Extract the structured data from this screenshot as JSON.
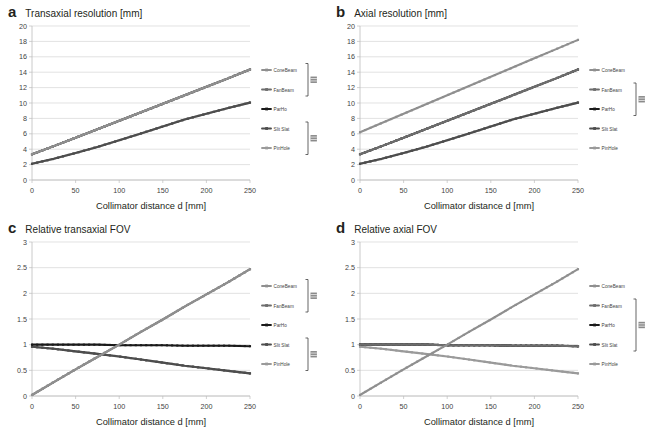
{
  "figure": {
    "xlabel": "Collimator distance d [mm]",
    "series_names": [
      "ConeBeam",
      "FanBeam",
      "ParHo",
      "Slit Slat",
      "PinHole"
    ],
    "colors": {
      "ConeBeam": "#8f8f8f",
      "FanBeam": "#6d6d6d",
      "ParHo": "#1a1a1a",
      "SlitSlat": "#4d4d4d",
      "PinHole": "#9a9a9a",
      "grid": "#d6d6d6",
      "axis": "#bdbdbd",
      "text": "#3f3f3f"
    }
  },
  "panels": [
    {
      "letter": "a",
      "title": "Transaxial resolution [mm]",
      "chart_data": {
        "type": "line",
        "title": "Transaxial resolution [mm]",
        "xlabel": "Collimator distance d [mm]",
        "ylabel": "Transaxial resolution [mm]",
        "xlim": [
          0,
          250
        ],
        "ylim": [
          0,
          20
        ],
        "xticks": [
          0,
          50,
          100,
          150,
          200,
          250
        ],
        "yticks": [
          0,
          2,
          4,
          6,
          8,
          10,
          12,
          14,
          16,
          18,
          20
        ],
        "grid": true,
        "legend_position": "right",
        "x": [
          0,
          25,
          50,
          75,
          100,
          125,
          150,
          175,
          200,
          225,
          250
        ],
        "series": [
          {
            "name": "ConeBeam",
            "values": [
              3.35,
              4.4,
              5.5,
              6.6,
              7.7,
              8.8,
              9.9,
              11.0,
              12.1,
              13.2,
              14.35
            ]
          },
          {
            "name": "FanBeam",
            "values": [
              3.35,
              4.4,
              5.5,
              6.6,
              7.7,
              8.8,
              9.9,
              11.0,
              12.1,
              13.2,
              14.35
            ]
          },
          {
            "name": "ParHo",
            "values": [
              3.35,
              4.4,
              5.5,
              6.6,
              7.7,
              8.8,
              9.9,
              11.0,
              12.1,
              13.2,
              14.35
            ]
          },
          {
            "name": "Slit Slat",
            "values": [
              2.1,
              2.75,
              3.5,
              4.3,
              5.15,
              6.05,
              6.95,
              7.85,
              8.6,
              9.35,
              10.05
            ]
          },
          {
            "name": "PinHole",
            "values": [
              2.1,
              2.75,
              3.5,
              4.3,
              5.15,
              6.05,
              6.95,
              7.85,
              8.6,
              9.35,
              10.05
            ]
          }
        ],
        "legend_brackets": [
          {
            "from": "ConeBeam",
            "to": "FanBeam"
          },
          {
            "from": "Slit Slat",
            "to": "PinHole"
          }
        ]
      }
    },
    {
      "letter": "b",
      "title": "Axial resolution [mm]",
      "chart_data": {
        "type": "line",
        "title": "Axial resolution [mm]",
        "xlabel": "Collimator distance d [mm]",
        "ylabel": "Axial resolution [mm]",
        "xlim": [
          0,
          250
        ],
        "ylim": [
          0,
          20
        ],
        "xticks": [
          0,
          50,
          100,
          150,
          200,
          250
        ],
        "yticks": [
          0,
          2,
          4,
          6,
          8,
          10,
          12,
          14,
          16,
          18,
          20
        ],
        "grid": true,
        "legend_position": "right",
        "x": [
          0,
          25,
          50,
          75,
          100,
          125,
          150,
          175,
          200,
          225,
          250
        ],
        "series": [
          {
            "name": "ConeBeam",
            "values": [
              6.2,
              7.4,
              8.6,
              9.8,
              11.0,
              12.2,
              13.4,
              14.6,
              15.8,
              17.0,
              18.2
            ]
          },
          {
            "name": "FanBeam",
            "values": [
              3.35,
              4.4,
              5.5,
              6.6,
              7.7,
              8.8,
              9.9,
              11.0,
              12.1,
              13.2,
              14.35
            ]
          },
          {
            "name": "ParHo",
            "values": [
              3.35,
              4.4,
              5.5,
              6.6,
              7.7,
              8.8,
              9.9,
              11.0,
              12.1,
              13.2,
              14.35
            ]
          },
          {
            "name": "Slit Slat",
            "values": [
              2.1,
              2.75,
              3.5,
              4.3,
              5.15,
              6.05,
              6.95,
              7.85,
              8.6,
              9.35,
              10.05
            ]
          },
          {
            "name": "PinHole",
            "values": [
              2.1,
              2.75,
              3.5,
              4.3,
              5.15,
              6.05,
              6.95,
              7.85,
              8.6,
              9.35,
              10.05
            ]
          }
        ],
        "legend_brackets": [
          {
            "from": "FanBeam",
            "to": "ParHo"
          }
        ]
      }
    },
    {
      "letter": "c",
      "title": "Relative transaxial FOV",
      "chart_data": {
        "type": "line",
        "title": "Relative transaxial FOV",
        "xlabel": "Collimator distance d [mm]",
        "ylabel": "Relative transaxial FOV",
        "xlim": [
          0,
          250
        ],
        "ylim": [
          0,
          3
        ],
        "xticks": [
          0,
          50,
          100,
          150,
          200,
          250
        ],
        "yticks": [
          0,
          0.5,
          1,
          1.5,
          2,
          2.5,
          3
        ],
        "grid": true,
        "legend_position": "right",
        "x": [
          0,
          25,
          50,
          75,
          100,
          125,
          150,
          175,
          200,
          225,
          250
        ],
        "series": [
          {
            "name": "ConeBeam",
            "values": [
              0.02,
              0.27,
              0.52,
              0.76,
              1.0,
              1.25,
              1.49,
              1.74,
              1.98,
              2.22,
              2.47
            ]
          },
          {
            "name": "FanBeam",
            "values": [
              0.02,
              0.27,
              0.52,
              0.76,
              1.0,
              1.25,
              1.49,
              1.74,
              1.98,
              2.22,
              2.47
            ]
          },
          {
            "name": "ParHo",
            "values": [
              1.0,
              1.0,
              1.0,
              1.0,
              0.99,
              0.99,
              0.99,
              0.98,
              0.98,
              0.98,
              0.97
            ]
          },
          {
            "name": "Slit Slat",
            "values": [
              0.96,
              0.92,
              0.87,
              0.82,
              0.77,
              0.71,
              0.65,
              0.59,
              0.54,
              0.49,
              0.44
            ]
          },
          {
            "name": "PinHole",
            "values": [
              0.96,
              0.92,
              0.87,
              0.82,
              0.77,
              0.71,
              0.65,
              0.59,
              0.54,
              0.49,
              0.44
            ]
          }
        ],
        "legend_brackets": [
          {
            "from": "ConeBeam",
            "to": "FanBeam"
          },
          {
            "from": "Slit Slat",
            "to": "PinHole"
          }
        ]
      }
    },
    {
      "letter": "d",
      "title": "Relative axial FOV",
      "chart_data": {
        "type": "line",
        "title": "Relative axial FOV",
        "xlabel": "Collimator distance d [mm]",
        "ylabel": "Relative axial FOV",
        "xlim": [
          0,
          250
        ],
        "ylim": [
          0,
          3
        ],
        "xticks": [
          0,
          50,
          100,
          150,
          200,
          250
        ],
        "yticks": [
          0,
          0.5,
          1,
          1.5,
          2,
          2.5,
          3
        ],
        "grid": true,
        "legend_position": "right",
        "x": [
          0,
          25,
          50,
          75,
          100,
          125,
          150,
          175,
          200,
          225,
          250
        ],
        "series": [
          {
            "name": "ConeBeam",
            "values": [
              0.02,
              0.27,
              0.52,
              0.76,
              1.0,
              1.25,
              1.49,
              1.74,
              1.98,
              2.22,
              2.47
            ]
          },
          {
            "name": "FanBeam",
            "values": [
              1.0,
              1.0,
              1.0,
              1.0,
              0.99,
              0.99,
              0.99,
              0.98,
              0.98,
              0.98,
              0.97
            ]
          },
          {
            "name": "ParHo",
            "values": [
              1.0,
              1.0,
              1.0,
              1.0,
              0.99,
              0.99,
              0.99,
              0.98,
              0.98,
              0.98,
              0.97
            ]
          },
          {
            "name": "Slit Slat",
            "values": [
              1.0,
              1.0,
              1.0,
              1.0,
              0.99,
              0.99,
              0.99,
              0.98,
              0.98,
              0.98,
              0.97
            ]
          },
          {
            "name": "PinHole",
            "values": [
              0.96,
              0.92,
              0.87,
              0.82,
              0.77,
              0.71,
              0.65,
              0.59,
              0.54,
              0.49,
              0.44
            ]
          }
        ],
        "legend_brackets": [
          {
            "from": "FanBeam",
            "to": "Slit Slat"
          }
        ]
      }
    }
  ]
}
